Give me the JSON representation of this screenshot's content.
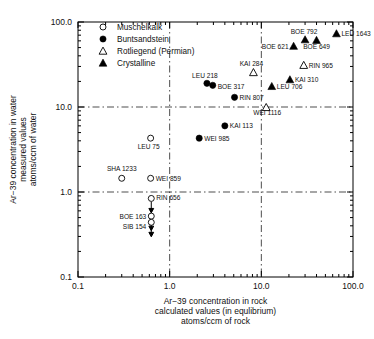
{
  "chart_data": {
    "type": "scatter",
    "title": "",
    "xlabel": "Ar-39 concentration in rock calculated values (in equilibrium) atoms/ccm of rock",
    "ylabel": "Ar-39 concentration in water measured values atoms/ccm of water",
    "xlabel_lines": [
      "Ar−39 concentration in rock",
      "calculated values (in equlibrium)",
      "atoms/ccm of rock"
    ],
    "ylabel_lines": [
      "Ar−39 concentration in water",
      "measured values",
      "atoms/ccm of water"
    ],
    "xscale": "log",
    "yscale": "log",
    "xlim": [
      0.1,
      100.0
    ],
    "ylim": [
      0.1,
      100.0
    ],
    "grid": true,
    "grid_x": [
      1.0,
      10.0
    ],
    "grid_y": [
      1.0,
      10.0
    ],
    "xticks": [
      "0.1",
      "1.0",
      "10.0",
      "100.0"
    ],
    "xtick_values": [
      0.1,
      1.0,
      10.0,
      100.0
    ],
    "yticks": [
      "100.0",
      "10.0",
      "1.0",
      "0.1"
    ],
    "ytick_values": [
      100.0,
      10.0,
      1.0,
      0.1
    ],
    "legend_position": "top-left-inside",
    "legend": [
      {
        "label": "Muschelkalk",
        "marker": "open-circle"
      },
      {
        "label": "Buntsandstein",
        "marker": "filled-circle"
      },
      {
        "label": "Rotliegend (Permian)",
        "marker": "open-triangle"
      },
      {
        "label": "Crystalline",
        "marker": "filled-triangle"
      }
    ],
    "series": [
      {
        "name": "Muschelkalk",
        "marker": "open-circle",
        "points": [
          {
            "label": "LEU 75",
            "x": 0.62,
            "y": 4.3,
            "label_dx": -2,
            "label_dy": 11,
            "anchor": "middle"
          },
          {
            "label": "SHA 1233",
            "x": 0.3,
            "y": 1.45,
            "label_dx": 0,
            "label_dy": -7,
            "anchor": "middle"
          },
          {
            "label": "WEI 859",
            "x": 0.62,
            "y": 1.45,
            "label_dx": 5,
            "label_dy": 2.5,
            "anchor": "start"
          },
          {
            "label": "RIN 656",
            "x": 0.63,
            "y": 0.84,
            "label_dx": 5,
            "label_dy": 2,
            "anchor": "start",
            "uplimit": true
          },
          {
            "label": "BOE 163",
            "x": 0.63,
            "y": 0.52,
            "label_dx": -5,
            "label_dy": 2.5,
            "anchor": "end",
            "uplimit": true
          },
          {
            "label": "SIB 154",
            "x": 0.63,
            "y": 0.44,
            "label_dx": -5,
            "label_dy": 6.5,
            "anchor": "end",
            "uplimit": true
          }
        ]
      },
      {
        "name": "Buntsandstein",
        "marker": "filled-circle",
        "points": [
          {
            "label": "LEU 218",
            "x": 2.55,
            "y": 19.0,
            "label_dx": -2,
            "label_dy": -5,
            "anchor": "middle"
          },
          {
            "label": "BOE 317",
            "x": 2.95,
            "y": 18.0,
            "label_dx": 5,
            "label_dy": 3.5,
            "anchor": "start"
          },
          {
            "label": "RIN 807",
            "x": 5.1,
            "y": 13.0,
            "label_dx": 5,
            "label_dy": 2.5,
            "anchor": "start"
          },
          {
            "label": "KAI 113",
            "x": 4.0,
            "y": 6.0,
            "label_dx": 5,
            "label_dy": 2.5,
            "anchor": "start"
          },
          {
            "label": "WEI 985",
            "x": 2.1,
            "y": 4.3,
            "label_dx": 5,
            "label_dy": 2.5,
            "anchor": "start"
          }
        ]
      },
      {
        "name": "Rotliegend (Permian)",
        "marker": "open-triangle",
        "points": [
          {
            "label": "KAI 284",
            "x": 8.2,
            "y": 25.5,
            "label_dx": -2,
            "label_dy": -6,
            "anchor": "middle"
          },
          {
            "label": "RIN 965",
            "x": 29.0,
            "y": 31.0,
            "label_dx": 5,
            "label_dy": 2.5,
            "anchor": "start"
          },
          {
            "label": "WEI 1116",
            "x": 11.3,
            "y": 9.9,
            "label_dx": 1,
            "label_dy": 8,
            "anchor": "middle"
          }
        ]
      },
      {
        "name": "Crystalline",
        "marker": "filled-triangle",
        "points": [
          {
            "label": "LEU 706",
            "x": 13.0,
            "y": 17.5,
            "label_dx": 5,
            "label_dy": 3,
            "anchor": "start"
          },
          {
            "label": "KAI 310",
            "x": 20.5,
            "y": 21.0,
            "label_dx": 5,
            "label_dy": 2.5,
            "anchor": "start"
          },
          {
            "label": "BOE 621",
            "x": 22.5,
            "y": 52.0,
            "label_dx": -5,
            "label_dy": 2.5,
            "anchor": "end"
          },
          {
            "label": "BOE 792",
            "x": 30.0,
            "y": 62.0,
            "label_dx": -1,
            "label_dy": -6,
            "anchor": "middle"
          },
          {
            "label": "BOE 649",
            "x": 40.0,
            "y": 61.0,
            "label_dx": 0,
            "label_dy": 9,
            "anchor": "middle"
          },
          {
            "label": "LEU 1643",
            "x": 66.0,
            "y": 73.0,
            "label_dx": 5,
            "label_dy": 2.5,
            "anchor": "start"
          }
        ]
      }
    ]
  },
  "colors": {
    "axis": "#000000",
    "marker": "#000000",
    "background": "#ffffff"
  }
}
